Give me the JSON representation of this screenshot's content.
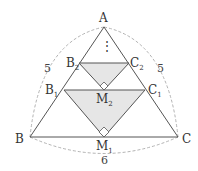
{
  "diagram": {
    "type": "geometry",
    "colors": {
      "line": "#555555",
      "dashed": "#aaaaaa",
      "shade": "#e6e6e6",
      "text": "#333333"
    },
    "points": {
      "A": {
        "label": "A",
        "sub": ""
      },
      "B": {
        "label": "B",
        "sub": ""
      },
      "C": {
        "label": "C",
        "sub": ""
      },
      "B1": {
        "label": "B",
        "sub": "1"
      },
      "C1": {
        "label": "C",
        "sub": "1"
      },
      "M1": {
        "label": "M",
        "sub": "1"
      },
      "B2": {
        "label": "B",
        "sub": "2"
      },
      "C2": {
        "label": "C",
        "sub": "2"
      },
      "M2": {
        "label": "M",
        "sub": "2"
      }
    },
    "measures": {
      "AB": "5",
      "AC": "5",
      "BC": "6"
    },
    "ellipsis": "⋮"
  }
}
